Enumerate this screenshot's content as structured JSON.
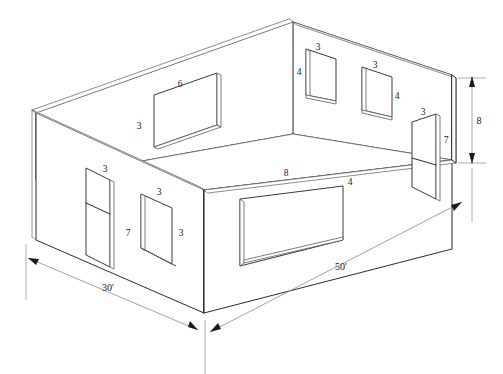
{
  "drawing": {
    "title": "Isometric room shell with window and door openings",
    "type": "isometric-architectural",
    "units": "feet",
    "line_color": "#2b2b2b",
    "light_line_color": "#7a7a7a",
    "background": "#ffffff"
  },
  "overall_dimensions": [
    {
      "id": "length",
      "label": "50'",
      "value": 50,
      "unit": "ft",
      "edge": "front-right-base"
    },
    {
      "id": "width",
      "label": "30'",
      "value": 30,
      "unit": "ft",
      "edge": "front-left-base"
    },
    {
      "id": "height",
      "label": "8",
      "value": 8,
      "unit": "ft",
      "edge": "right-vertical"
    }
  ],
  "openings": [
    {
      "id": "back-left-window",
      "kind": "window",
      "wall": "back-left",
      "width_label": "6",
      "height_label": "3",
      "width": 6,
      "height": 3
    },
    {
      "id": "back-right-window-1",
      "kind": "window",
      "wall": "back-right",
      "width_label": "3",
      "height_label": "4",
      "width": 3,
      "height": 4
    },
    {
      "id": "back-right-window-2",
      "kind": "window",
      "wall": "back-right",
      "width_label": "3",
      "height_label": "4",
      "width": 3,
      "height": 4
    },
    {
      "id": "right-door",
      "kind": "door",
      "wall": "back-right",
      "width_label": "3",
      "height_label": "7",
      "width": 3,
      "height": 7
    },
    {
      "id": "front-right-window",
      "kind": "window",
      "wall": "front-right",
      "width_label": "8",
      "height_label": "4",
      "width": 8,
      "height": 4
    },
    {
      "id": "front-left-door",
      "kind": "door",
      "wall": "front-left",
      "width_label": "3",
      "height_label": "7",
      "width": 3,
      "height": 7
    },
    {
      "id": "front-left-window",
      "kind": "window",
      "wall": "front-left",
      "width_label": "3",
      "height_label": "3",
      "width": 3,
      "height": 3
    }
  ],
  "labels": {
    "dim_50": "50'",
    "dim_30": "30'",
    "dim_8_height": "8",
    "back_left_window_w": "6",
    "back_left_window_h": "3",
    "br_window1_w": "3",
    "br_window1_h": "4",
    "br_window2_w": "3",
    "br_window2_h": "4",
    "right_door_w": "3",
    "right_door_h": "7",
    "front_window_w": "8",
    "front_window_h": "4",
    "front_door_w": "3",
    "front_door_h": "7",
    "front_small_window_w": "3",
    "front_small_window_h": "3"
  }
}
